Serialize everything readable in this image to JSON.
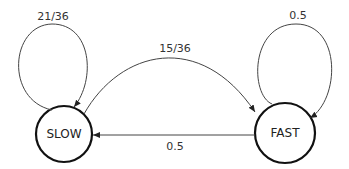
{
  "diagram": {
    "type": "state-transition",
    "nodes": [
      {
        "id": "slow",
        "label": "SLOW"
      },
      {
        "id": "fast",
        "label": "FAST"
      }
    ],
    "edges": [
      {
        "from": "slow",
        "to": "slow",
        "label": "21/36"
      },
      {
        "from": "slow",
        "to": "fast",
        "label": "15/36"
      },
      {
        "from": "fast",
        "to": "fast",
        "label": "0.5"
      },
      {
        "from": "fast",
        "to": "slow",
        "label": "0.5"
      }
    ]
  }
}
